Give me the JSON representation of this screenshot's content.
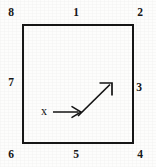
{
  "figure": {
    "name": "square-direction-diagram",
    "background_color": "#fdfdfc",
    "stroke_color": "#171717",
    "width": 156,
    "height": 167
  },
  "square": {
    "name": "square-outline",
    "left": 23,
    "top": 25,
    "right": 133,
    "bottom": 143,
    "stroke_width": 1.6
  },
  "node_labels": [
    {
      "id": "label-8",
      "text": "8",
      "x": 10,
      "y": 13,
      "position": "top-left-corner"
    },
    {
      "id": "label-1",
      "text": "1",
      "x": 76,
      "y": 13,
      "position": "top-edge-midpoint"
    },
    {
      "id": "label-2",
      "text": "2",
      "x": 140,
      "y": 13,
      "position": "top-right-corner"
    },
    {
      "id": "label-3",
      "text": "3",
      "x": 139,
      "y": 88,
      "position": "right-edge-midpoint"
    },
    {
      "id": "label-4",
      "text": "4",
      "x": 140,
      "y": 155,
      "position": "bottom-right-corner"
    },
    {
      "id": "label-5",
      "text": "5",
      "x": 76,
      "y": 155,
      "position": "bottom-edge-midpoint"
    },
    {
      "id": "label-6",
      "text": "6",
      "x": 11,
      "y": 155,
      "position": "bottom-left-corner"
    },
    {
      "id": "label-7",
      "text": "7",
      "x": 10,
      "y": 83,
      "position": "left-edge-midpoint"
    }
  ],
  "axis": {
    "x_label": "x",
    "x_label_pos": {
      "x": 41,
      "y": 106
    }
  },
  "arrows": [
    {
      "id": "horizontal-arrow",
      "name": "x-axis-arrow",
      "from": {
        "x": 53,
        "y": 112
      },
      "to": {
        "x": 81,
        "y": 112
      },
      "direction": "right"
    },
    {
      "id": "diagonal-arrow",
      "name": "diagonal-direction-arrow",
      "from": {
        "x": 78,
        "y": 116
      },
      "to": {
        "x": 112,
        "y": 83
      },
      "direction": "up-right",
      "angle_deg": 45
    }
  ]
}
